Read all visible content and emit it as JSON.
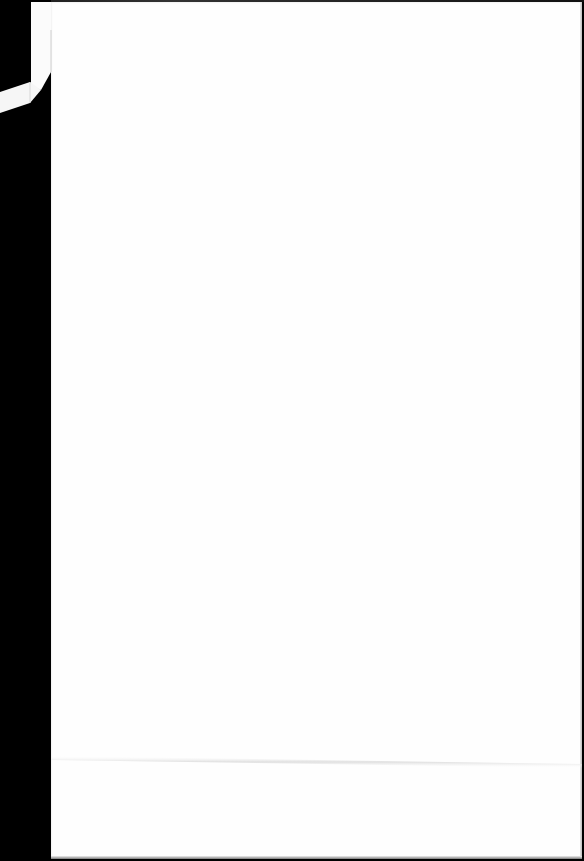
{
  "scene": {
    "description": "Blank white sheet of paper photographed on a black surface",
    "paper_color": "#fefefe",
    "background_color": "#000000",
    "features": [
      "folded-top-left-corner",
      "horizontal-crease-near-bottom"
    ],
    "text": ""
  }
}
